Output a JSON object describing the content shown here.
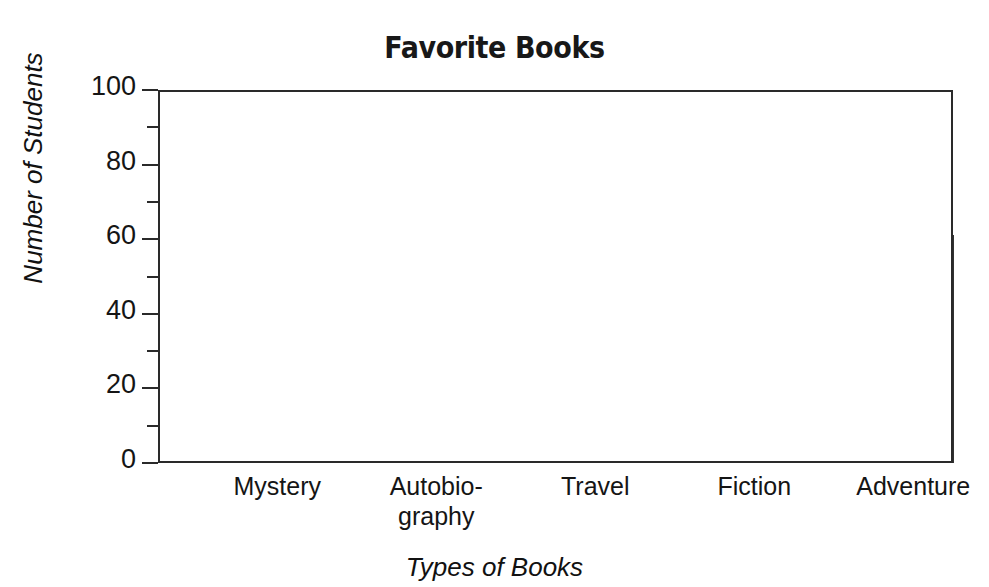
{
  "chart_data": {
    "type": "bar",
    "title": "Favorite Books",
    "xlabel": "Types of Books",
    "ylabel": "Number of Students",
    "categories": [
      "Mystery",
      "Autobio-\ngraphy",
      "Travel",
      "Fiction",
      "Adventure"
    ],
    "category_labels_display": [
      {
        "line1": "Mystery",
        "line2": ""
      },
      {
        "line1": "Autobio-",
        "line2": "graphy"
      },
      {
        "line1": "Travel",
        "line2": ""
      },
      {
        "line1": "Fiction",
        "line2": ""
      },
      {
        "line1": "Adventure",
        "line2": ""
      }
    ],
    "values": [
      80,
      30,
      20,
      50,
      61
    ],
    "ylim": [
      0,
      100
    ],
    "ytick_major": [
      0,
      20,
      40,
      60,
      80,
      100
    ],
    "ytick_minor": [
      10,
      30,
      50,
      70,
      90
    ],
    "ytick_labels": [
      "0",
      "20",
      "40",
      "60",
      "80",
      "100"
    ],
    "grid": true,
    "grid_horizontal_at": [
      20,
      40,
      60,
      80
    ],
    "grid_vertical_cells": 10,
    "legend": null,
    "bar_fill_color": "#d2d2d2",
    "bar_edge_color": "#333333",
    "grid_color": "#b4b4b4",
    "axis_color": "#2a2a2a",
    "background_color": "#ffffff"
  }
}
